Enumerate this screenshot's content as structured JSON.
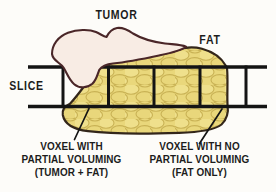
{
  "figure": {
    "type": "medical-diagram-partial-volume-effect",
    "labels": {
      "tumor": "TUMOR",
      "fat": "FAT",
      "slice": "SLICE"
    },
    "captions": {
      "left": {
        "line1": "VOXEL WITH",
        "line2": "PARTIAL VOLUMING",
        "line3": "(TUMOR + FAT)"
      },
      "right": {
        "line1": "VOXEL WITH NO",
        "line2": "PARTIAL VOLUMING",
        "line3": "(FAT ONLY)"
      }
    },
    "colors": {
      "background": "#fdfcf9",
      "tumor_fill": "#f8ece4",
      "tumor_outline": "#4a2628",
      "fat_fill": "#e9d77b",
      "fat_lump_light": "#efe08c",
      "fat_lump_line": "#c9b254",
      "fat_outline": "#33261a",
      "grid_line": "#141414",
      "leader_line": "#141414",
      "text": "#1c1c1c"
    }
  }
}
